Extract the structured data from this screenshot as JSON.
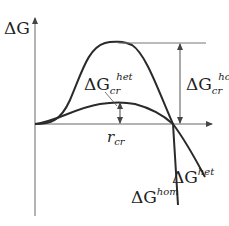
{
  "diagram": {
    "axis_y_label": "ΔG",
    "axis_x_label_sym": "r",
    "axis_x_label_sub": "cr",
    "labels": {
      "dG_cr_hom": {
        "delta": "ΔG",
        "sub": "cr",
        "sup": "hom"
      },
      "dG_cr_het": {
        "delta": "ΔG",
        "sub": "cr",
        "sup": "het"
      },
      "dG_hom": {
        "delta": "ΔG",
        "sup": "hom"
      },
      "dG_het": {
        "delta": "ΔG",
        "sup": "het"
      }
    },
    "colors": {
      "line": "#2a2a2a",
      "axis": "#555555",
      "background": "#ffffff"
    }
  }
}
